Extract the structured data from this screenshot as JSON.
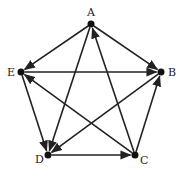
{
  "title": "",
  "nodes": [
    {
      "id": "A",
      "label": "A",
      "x": 91,
      "y": 24,
      "lx": 87,
      "ly": 16
    },
    {
      "id": "B",
      "label": "B",
      "x": 161,
      "y": 72,
      "lx": 168,
      "ly": 76
    },
    {
      "id": "C",
      "label": "C",
      "x": 135,
      "y": 155,
      "lx": 140,
      "ly": 164
    },
    {
      "id": "D",
      "label": "D",
      "x": 48,
      "y": 155,
      "lx": 35,
      "ly": 163
    },
    {
      "id": "E",
      "label": "E",
      "x": 21,
      "y": 72,
      "lx": 7,
      "ly": 76
    }
  ],
  "edges": [
    {
      "from": "A",
      "to": "E"
    },
    {
      "from": "A",
      "to": "B"
    },
    {
      "from": "A",
      "to": "D"
    },
    {
      "from": "C",
      "to": "A"
    },
    {
      "from": "E",
      "to": "B"
    },
    {
      "from": "E",
      "to": "D"
    },
    {
      "from": "C",
      "to": "E"
    },
    {
      "from": "B",
      "to": "D"
    },
    {
      "from": "C",
      "to": "B"
    },
    {
      "from": "D",
      "to": "C"
    }
  ],
  "colors": {
    "stroke": "#222222",
    "node": "#111111",
    "background": "#ffffff"
  }
}
